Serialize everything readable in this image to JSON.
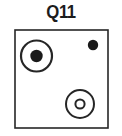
{
  "figure": {
    "title": "Q11",
    "background_color": "#ffffff",
    "stroke_color": "#262626",
    "fill_color": "#1a1a1a",
    "panel": {
      "name": "bounding-box",
      "x": 15,
      "y": 30,
      "width": 93,
      "height": 98,
      "stroke_width": 1.6
    },
    "shapes": [
      {
        "id": "large-concentric-circle",
        "type": "concentric-circle",
        "cx": 36.5,
        "cy": 56,
        "outer_r": 15.5,
        "outer_stroke": 2.2,
        "inner_r": 6.2,
        "inner_filled": true
      },
      {
        "id": "small-filled-dot",
        "type": "filled-circle",
        "cx": 93,
        "cy": 45,
        "r": 5.2,
        "inner_filled": true
      },
      {
        "id": "lower-ring-circle",
        "type": "concentric-ring",
        "cx": 80,
        "cy": 104,
        "outer_r": 14,
        "outer_stroke": 2.0,
        "inner_r": 4.6,
        "inner_stroke": 2.0,
        "inner_filled": false
      }
    ]
  }
}
